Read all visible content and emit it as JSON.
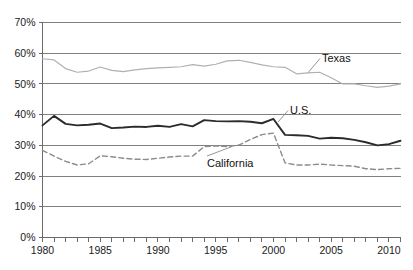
{
  "chart_data": {
    "type": "line",
    "title": "",
    "xlabel": "",
    "ylabel": "",
    "xlim": [
      1980,
      2011
    ],
    "ylim": [
      0,
      70
    ],
    "y_tick_step": 10,
    "x_tick_step": 1,
    "x_label_step": 5,
    "grid": true,
    "legend_position": "inline-annotations",
    "y_ticks": [
      "0%",
      "10%",
      "20%",
      "30%",
      "40%",
      "50%",
      "60%",
      "70%"
    ],
    "y_tick_values": [
      0,
      10,
      20,
      30,
      40,
      50,
      60,
      70
    ],
    "x_ticks": [
      "1980",
      "1985",
      "1990",
      "1995",
      "2000",
      "2005",
      "2010"
    ],
    "x_tick_values": [
      1980,
      1985,
      1990,
      1995,
      2000,
      2005,
      2010
    ],
    "x": [
      1980,
      1981,
      1982,
      1983,
      1984,
      1985,
      1986,
      1987,
      1988,
      1989,
      1990,
      1991,
      1992,
      1993,
      1994,
      1995,
      1996,
      1997,
      1998,
      1999,
      2000,
      2001,
      2002,
      2003,
      2004,
      2005,
      2006,
      2007,
      2008,
      2009,
      2010,
      2011
    ],
    "series": [
      {
        "name": "Texas",
        "color": "#b0b0b0",
        "style": "solid",
        "width": 1.2,
        "label": "Texas",
        "values": [
          58.2,
          57.8,
          55.0,
          53.8,
          54.2,
          55.5,
          54.4,
          54.0,
          54.6,
          55.0,
          55.2,
          55.4,
          55.6,
          56.3,
          55.8,
          56.4,
          57.5,
          57.7,
          57.0,
          56.2,
          55.6,
          55.4,
          53.3,
          53.6,
          53.8,
          52.0,
          50.0,
          50.0,
          49.4,
          48.9,
          49.3,
          50.0
        ]
      },
      {
        "name": "U.S.",
        "color": "#2b2b2b",
        "style": "solid",
        "width": 1.9,
        "label": "U.S.",
        "values": [
          36.5,
          39.6,
          37.0,
          36.5,
          36.7,
          37.1,
          35.6,
          35.8,
          36.1,
          36.0,
          36.4,
          36.0,
          36.9,
          36.2,
          38.2,
          37.9,
          37.8,
          37.9,
          37.7,
          37.2,
          38.6,
          33.4,
          33.3,
          33.1,
          32.2,
          32.5,
          32.3,
          31.8,
          31.0,
          30.0,
          30.4,
          31.5
        ]
      },
      {
        "name": "California",
        "color": "#8c8c8c",
        "style": "dashed",
        "width": 1.4,
        "label": "California",
        "values": [
          28.4,
          26.5,
          24.8,
          23.6,
          24.0,
          26.6,
          26.3,
          25.8,
          25.5,
          25.4,
          25.8,
          26.2,
          26.5,
          26.5,
          29.6,
          29.8,
          29.6,
          30.1,
          31.9,
          33.5,
          34.0,
          24.3,
          23.6,
          23.6,
          23.9,
          23.6,
          23.4,
          23.2,
          22.4,
          22.1,
          22.4,
          22.5
        ]
      }
    ],
    "annotations": [
      {
        "text": "Texas",
        "series": "Texas",
        "anchor_year": 2003.0,
        "anchor_value": 53.7,
        "x": 322,
        "y": 62
      },
      {
        "text": "U.S.",
        "series": "U.S.",
        "anchor_year": 2000.4,
        "anchor_value": 37.6,
        "x": 290,
        "y": 114
      },
      {
        "text": "California",
        "series": "California",
        "anchor_year": 1996.4,
        "anchor_value": 29.6,
        "x": 207,
        "y": 167
      }
    ]
  }
}
